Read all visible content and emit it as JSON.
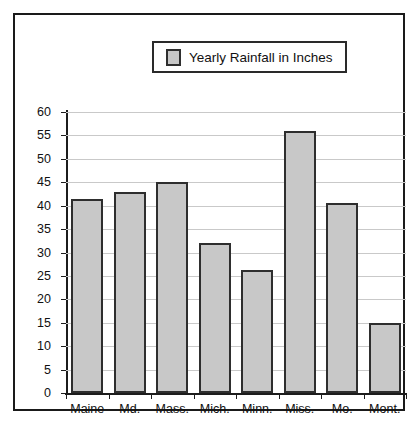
{
  "chart_data": {
    "type": "bar",
    "title": "",
    "legend": [
      "Yearly Rainfall in Inches"
    ],
    "legend_position": "top-center",
    "legend_swatch_color": "#c8c8c8",
    "categories": [
      "Maine",
      "Md.",
      "Mass.",
      "Mich.",
      "Minn.",
      "Miss.",
      "Mo.",
      "Mont."
    ],
    "values": [
      41.5,
      43,
      45,
      32,
      26.2,
      56,
      40.5,
      15
    ],
    "xlabel": "",
    "ylabel": "",
    "ylim": [
      0,
      60
    ],
    "yticks": [
      0,
      5,
      10,
      15,
      20,
      25,
      30,
      35,
      40,
      45,
      50,
      55,
      60
    ],
    "grid": true,
    "bar_color": "#c8c8c8",
    "bar_border_color": "#2e2e2e",
    "axis_color": "#1c1c1c",
    "grid_color": "#c9c9c9",
    "frame_border_color": "#1a1a1a"
  }
}
